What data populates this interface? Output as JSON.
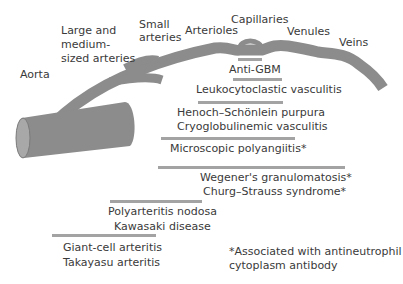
{
  "vessels": {
    "aorta": "Aorta",
    "large_medium_1": "Large and",
    "large_medium_2": "medium-",
    "large_medium_3": "sized arteries",
    "small_arteries_1": "Small",
    "small_arteries_2": "arteries",
    "arterioles": "Arterioles",
    "capillaries": "Capillaries",
    "venules": "Venules",
    "veins": "Veins"
  },
  "diseases": {
    "anti_gbm": "Anti-GBM",
    "leukocytoclastic": "Leukocytoclastic vasculitis",
    "hsp": "Henoch–Schönlein purpura",
    "cryo": "Cryoglobulinemic vasculitis",
    "mpa": "Microscopic polyangiitis*",
    "wegener": "Wegener's granulomatosis*",
    "churg": "Churg–Strauss syndrome*",
    "pan": "Polyarteritis nodosa",
    "kawasaki": "Kawasaki disease",
    "gca": "Giant-cell arteritis",
    "takayasu": "Takayasu arteritis"
  },
  "footnote": {
    "line1": "*Associated with antineutrophil",
    "line2": "cytoplasm antibody"
  },
  "colors": {
    "vessel": "#8c8c8c",
    "bar": "#a3a3a3",
    "text": "#3a3a3a"
  }
}
